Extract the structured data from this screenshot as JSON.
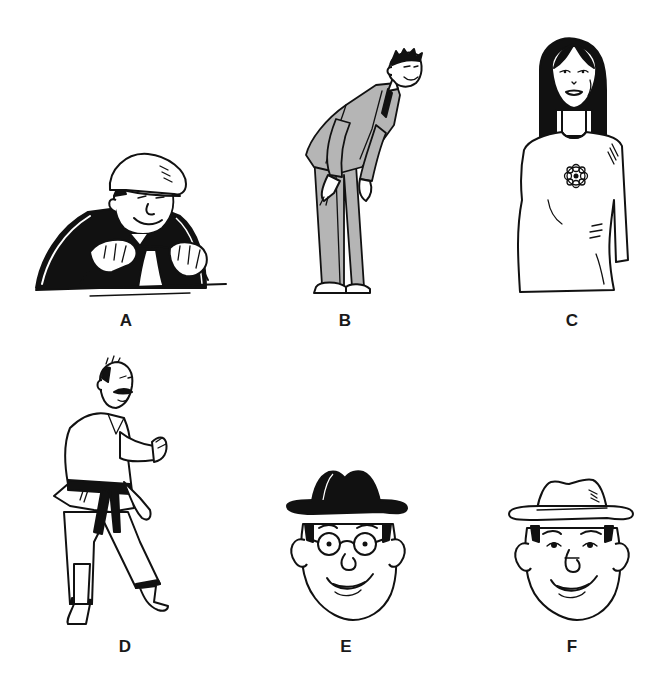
{
  "figures": [
    {
      "id": "A",
      "label": "A",
      "description": "Man in flat cap and dark jacket gripping a steering wheel"
    },
    {
      "id": "B",
      "label": "B",
      "description": "Tall thin man in grey suit and tie bending forward"
    },
    {
      "id": "C",
      "label": "C",
      "description": "Woman with long straight black hair in white top with flower brooch"
    },
    {
      "id": "D",
      "label": "D",
      "description": "Barefoot man with moustache in judo gi with black belt"
    },
    {
      "id": "E",
      "label": "E",
      "description": "Round face with glasses wearing a black fedora hat"
    },
    {
      "id": "F",
      "label": "F",
      "description": "Round face without glasses wearing a white fedora hat"
    }
  ],
  "colors": {
    "ink": "#111111",
    "suit_grey": "#b5b5b5",
    "background": "#ffffff"
  }
}
